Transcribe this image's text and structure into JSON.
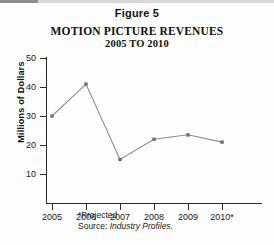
{
  "figure": {
    "number_label": "Figure 5",
    "title": "MOTION PICTURE REVENUES",
    "subtitle": "2005 TO 2010"
  },
  "footnotes": {
    "projected": "*Projected",
    "source_label": "Source:",
    "source_name": "Industry Profiles.",
    "source_full": "Source: Industry Profiles."
  },
  "colors": {
    "axis": "#2b2b2b",
    "series_line": "#8c8c8c",
    "marker": "#6e6e6e",
    "text": "#1a1a1a",
    "background": "#ffffff"
  },
  "chart_data": {
    "type": "line",
    "title": "MOTION PICTURE REVENUES",
    "subtitle": "2005 TO 2010",
    "xlabel": "",
    "ylabel": "Millions of Dollars",
    "categories": [
      "2005",
      "2006",
      "2007",
      "2008",
      "2009",
      "2010*"
    ],
    "x": [
      2005,
      2006,
      2007,
      2008,
      2009,
      2010
    ],
    "values": [
      30,
      41,
      15,
      22,
      23.5,
      21
    ],
    "series": [
      {
        "name": "Motion Picture Revenues",
        "values": [
          30,
          41,
          15,
          22,
          23.5,
          21
        ]
      }
    ],
    "ylim": [
      0,
      50
    ],
    "yticks": [
      10,
      20,
      30,
      40,
      50
    ],
    "ytick_labels": [
      "10",
      "20",
      "30",
      "40",
      "50"
    ],
    "grid": false,
    "legend": false,
    "legend_position": "none",
    "markers": "square",
    "annotations": [
      "*Projected",
      "Source: Industry Profiles."
    ]
  }
}
